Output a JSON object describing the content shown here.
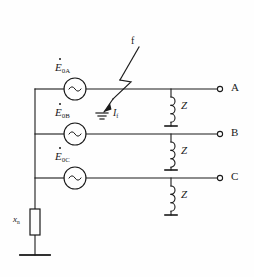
{
  "diagram": {
    "background_color": "#fefefe",
    "line_color": "#1a1a1a"
  },
  "sources": [
    {
      "symbol": "E",
      "subscript": "0A",
      "phase": "A",
      "icon": "ac-source-icon",
      "glyph": "~"
    },
    {
      "symbol": "E",
      "subscript": "0B",
      "phase": "B",
      "icon": "ac-source-icon",
      "glyph": "~"
    },
    {
      "symbol": "E",
      "subscript": "0C",
      "phase": "C",
      "icon": "ac-source-icon",
      "glyph": "~"
    }
  ],
  "loads": [
    {
      "label": "Z",
      "phase": "A",
      "icon": "inductor-icon"
    },
    {
      "label": "Z",
      "phase": "B",
      "icon": "inductor-icon"
    },
    {
      "label": "Z",
      "phase": "C",
      "icon": "inductor-icon"
    }
  ],
  "terminals": [
    {
      "label": "A"
    },
    {
      "label": "B"
    },
    {
      "label": "C"
    }
  ],
  "fault": {
    "marker_label": "f",
    "current_symbol": "I",
    "current_subscript": "f",
    "ground_icon": "ground-icon",
    "arrow_icon": "fault-arrow-icon"
  },
  "neutral": {
    "symbol": "x",
    "subscript": "n",
    "element_icon": "impedance-box-icon",
    "ground_icon": "ground-icon"
  }
}
